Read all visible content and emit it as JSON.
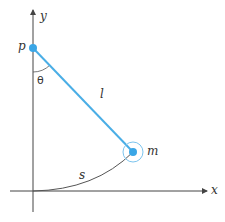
{
  "diagram": {
    "labels": {
      "y_axis": "y",
      "x_axis": "x",
      "pivot": "p",
      "angle": "θ",
      "length": "l",
      "mass": "m",
      "arc_length": "s"
    },
    "colors": {
      "rod": "#4aaee6",
      "pivot": "#3aa6e6",
      "mass": "#3aa6e6",
      "mass_ring": "#7cc4ee",
      "axes": "#444444",
      "arc": "#555555",
      "text": "#333333"
    },
    "geometry": {
      "origin": [
        33,
        191
      ],
      "pivot": [
        33,
        48
      ],
      "mass": [
        133,
        152
      ],
      "mass_ring_radius": 10
    }
  }
}
